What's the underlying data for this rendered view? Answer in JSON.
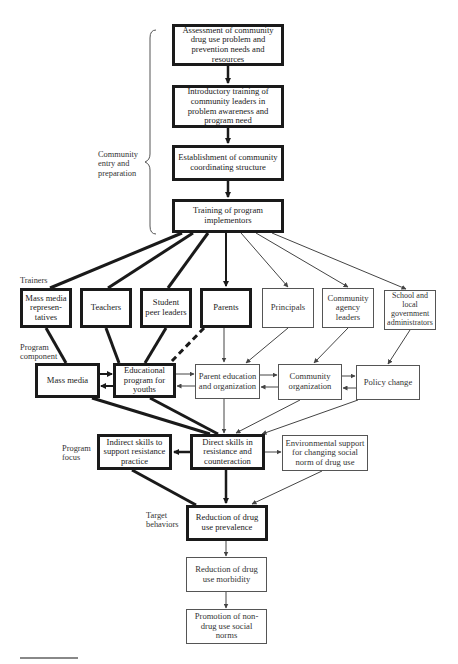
{
  "figure": {
    "section_labels": {
      "community_entry": "Community entry and preparation",
      "trainers": "Trainers",
      "program_component": "Program component",
      "program_focus": "Program focus",
      "target_behaviors": "Target behaviors"
    },
    "nodes": {
      "assessment": "Assessment of community drug use problem and prevention needs and resources",
      "introductory": "Introductory training of community leaders in problem awareness and program need",
      "establishment": "Establishment of community coordinating structure",
      "training": "Training of program implementors",
      "mass_media_reps": "Mass media represen-tatives",
      "teachers": "Teachers",
      "student_peer": "Student peer leaders",
      "parents": "Parents",
      "principals": "Principals",
      "community_agency": "Community agency leaders",
      "school_gov": "School and local government administrators",
      "mass_media": "Mass media",
      "educational_program": "Educational program for youths",
      "parent_education": "Parent education and organization",
      "community_org": "Community organization",
      "policy_change": "Policy change",
      "indirect_skills": "Indirect skills to support resistance practice",
      "direct_skills": "Direct skills in resistance and counteraction",
      "environmental": "Environmental support for changing social norm of drug use",
      "reduction_prevalence": "Reduction of drug use prevalence",
      "reduction_morbidity": "Reduction of drug use morbidity",
      "promotion": "Promotion of non-drug use social norms"
    },
    "colors": {
      "thick_stroke": "#1a1a1a",
      "thin_stroke": "#555555",
      "background": "#ffffff"
    }
  }
}
